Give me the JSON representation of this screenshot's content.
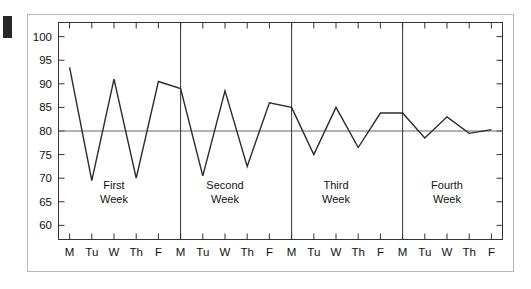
{
  "figure": {
    "background_color": "#ffffff",
    "frame_color": "#b9b9b9",
    "line_color": "#2b2b2b",
    "reference_line_color": "#666666",
    "axis_color": "#333333"
  },
  "chart_data": {
    "type": "line",
    "title": "",
    "subtitle": "",
    "xlabel": "",
    "ylabel": "",
    "ylim": [
      57,
      103
    ],
    "yticks": [
      60,
      65,
      70,
      75,
      80,
      85,
      90,
      95,
      100
    ],
    "ytick_labels": [
      "60",
      "65",
      "70",
      "75",
      "80",
      "85",
      "90",
      "95",
      "100"
    ],
    "grid": false,
    "legend": "none",
    "reference_lines": [
      {
        "axis": "y",
        "value": 80,
        "label": ""
      }
    ],
    "group_dividers": [
      5,
      10,
      15
    ],
    "groups": [
      {
        "label_line1": "First",
        "label_line2": "Week",
        "start_index": 0,
        "end_index": 4
      },
      {
        "label_line1": "Second",
        "label_line2": "Week",
        "start_index": 5,
        "end_index": 9
      },
      {
        "label_line1": "Third",
        "label_line2": "Week",
        "start_index": 10,
        "end_index": 14
      },
      {
        "label_line1": "Fourth",
        "label_line2": "Week",
        "start_index": 15,
        "end_index": 19
      }
    ],
    "categories": [
      "M",
      "Tu",
      "W",
      "Th",
      "F",
      "M",
      "Tu",
      "W",
      "Th",
      "F",
      "M",
      "Tu",
      "W",
      "Th",
      "F",
      "M",
      "Tu",
      "W",
      "Th",
      "F"
    ],
    "x": [
      1,
      2,
      3,
      4,
      5,
      6,
      7,
      8,
      9,
      10,
      11,
      12,
      13,
      14,
      15,
      16,
      17,
      18,
      19,
      20
    ],
    "values": [
      93.5,
      69.5,
      91.0,
      70.0,
      90.5,
      89.0,
      70.5,
      88.5,
      72.5,
      86.0,
      85.0,
      75.0,
      85.0,
      76.5,
      83.8,
      83.8,
      78.5,
      83.0,
      79.5,
      80.3
    ],
    "series": [
      {
        "name": "",
        "values": [
          93.5,
          69.5,
          91.0,
          70.0,
          90.5,
          89.0,
          70.5,
          88.5,
          72.5,
          86.0,
          85.0,
          75.0,
          85.0,
          76.5,
          83.8,
          83.8,
          78.5,
          83.0,
          79.5,
          80.3
        ]
      }
    ]
  }
}
